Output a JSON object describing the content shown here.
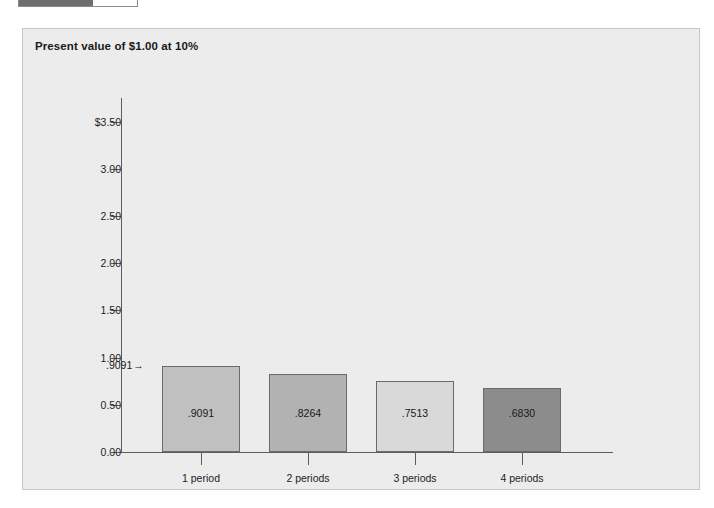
{
  "progress": {
    "name": "progress-bar",
    "percent": 63,
    "fill_color": "#6e6e6e",
    "track_color": "#ffffff"
  },
  "panel": {
    "title": "Present value of $1.00 at 10%",
    "background_color": "#ececec",
    "border_color": "#c8c8c8"
  },
  "chart_data": {
    "type": "bar",
    "title": "Present value of $1.00 at 10%",
    "xlabel": "",
    "ylabel": "",
    "categories": [
      "1 period",
      "2 periods",
      "3 periods",
      "4 periods"
    ],
    "values": [
      0.9091,
      0.8264,
      0.7513,
      0.683
    ],
    "value_labels": [
      ".9091",
      ".8264",
      ".7513",
      ".6830"
    ],
    "bar_colors": [
      "#c0c0c0",
      "#b2b2b2",
      "#d9d9d9",
      "#8c8c8c"
    ],
    "bar_border_color": "#6b6b6b",
    "ylim": [
      0,
      3.75
    ],
    "yticks": [
      0.0,
      0.5,
      1.0,
      1.5,
      2.0,
      2.5,
      3.0,
      3.5
    ],
    "ytick_labels": [
      "0.00",
      "0.50",
      "1.00",
      "1.50",
      "2.00",
      "2.50",
      "3.00",
      "$3.50"
    ],
    "grid": false,
    "legend": false,
    "annotations": [
      {
        "text": ".9091",
        "arrow": "→",
        "target_category": "1 period",
        "position": "left-of-bar-top"
      }
    ]
  }
}
